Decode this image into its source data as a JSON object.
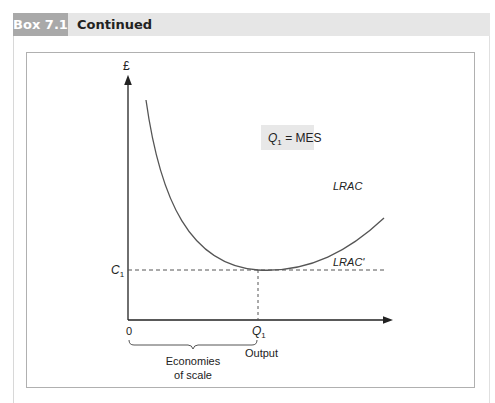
{
  "header": {
    "box_label": "Box 7.1",
    "title": "Continued"
  },
  "diagram": {
    "y_axis_label": "£",
    "x_axis_label": "Output",
    "origin_label": "0",
    "c1_label": "C",
    "c1_sub": "1",
    "q1_label": "Q",
    "q1_sub": "1",
    "annotation_q": "Q",
    "annotation_sub": "1",
    "annotation_rest": " = MES",
    "curve_label": "LRAC",
    "curve_label_alt": "LRAC'",
    "brace_label_line1": "Economies",
    "brace_label_line2": "of scale",
    "colors": {
      "axis": "#222222",
      "curve": "#555555",
      "dashed": "#555555",
      "annotation_bg": "#e8e8e8"
    }
  }
}
